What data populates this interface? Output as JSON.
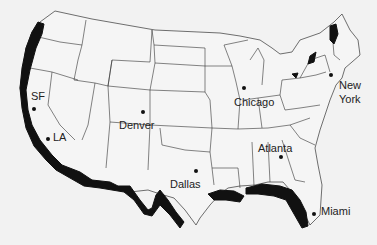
{
  "map": {
    "title": "",
    "region": "Contiguous United States",
    "highlight_color": "#111111",
    "background_color": "#f2f2f2",
    "cities": [
      {
        "name": "SF",
        "dot": [
          34,
          109
        ],
        "label_pos": [
          31,
          90
        ]
      },
      {
        "name": "LA",
        "dot": [
          48,
          139
        ],
        "label_pos": [
          53,
          131
        ]
      },
      {
        "name": "Denver",
        "dot": [
          143,
          112
        ],
        "label_pos": [
          119,
          119
        ]
      },
      {
        "name": "Chicago",
        "dot": [
          244,
          88
        ],
        "label_pos": [
          234,
          96
        ]
      },
      {
        "name": "New York",
        "dot": [
          331,
          75
        ],
        "label_pos": [
          339,
          79
        ]
      },
      {
        "name": "Atlanta",
        "dot": [
          281,
          157
        ],
        "label_pos": [
          258,
          142
        ]
      },
      {
        "name": "Dallas",
        "dot": [
          196,
          171
        ],
        "label_pos": [
          170,
          178
        ]
      },
      {
        "name": "Miami",
        "dot": [
          314,
          214
        ],
        "label_pos": [
          321,
          205
        ]
      }
    ],
    "labels": {
      "sf": "SF",
      "la": "LA",
      "denver": "Denver",
      "chicago": "Chicago",
      "new_york_line1": "New",
      "new_york_line2": "York",
      "atlanta": "Atlanta",
      "dallas": "Dallas",
      "miami": "Miami"
    }
  }
}
